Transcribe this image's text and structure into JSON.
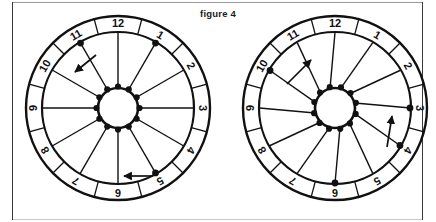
{
  "figure": {
    "title": "figure 4",
    "background_color": "#ffffff",
    "ink_color": "#111111",
    "frame_color": "#3a3a3a"
  },
  "chart_data": {
    "type": "diagram",
    "title": "figure 4",
    "subtitle": "",
    "xlabel": "",
    "ylabel": "",
    "panels": [
      {
        "id": "left",
        "name": "wheel-left",
        "ring_labels": [
          "12",
          "1",
          "2",
          "3",
          "4",
          "5",
          "6",
          "7",
          "8",
          "9",
          "10",
          "11"
        ],
        "segment_count": 12,
        "spoke_count": 12,
        "hub_dot_count": 12,
        "rim_dot_positions": [
          "11",
          "1",
          "5"
        ],
        "hub_offset_degrees": 0,
        "arrows": [
          {
            "name": "arrow-upper-left",
            "direction": "counterclockwise",
            "glyph": "arrow-left-down",
            "near_label": "10"
          },
          {
            "name": "arrow-lower",
            "direction": "counterclockwise",
            "glyph": "arrow-left",
            "near_label": "6"
          }
        ]
      },
      {
        "id": "right",
        "name": "wheel-right",
        "ring_labels": [
          "12",
          "1",
          "2",
          "3",
          "4",
          "5",
          "6",
          "7",
          "8",
          "9",
          "10",
          "11"
        ],
        "segment_count": 12,
        "spoke_count": 12,
        "hub_dot_count": 12,
        "rim_dot_positions": [
          "10",
          "3",
          "4",
          "6"
        ],
        "hub_offset_degrees": -14,
        "arrows": [
          {
            "name": "arrow-upper-left",
            "direction": "clockwise",
            "glyph": "arrow-up-right",
            "near_label": "11"
          },
          {
            "name": "arrow-right",
            "direction": "clockwise",
            "glyph": "arrow-up",
            "near_label": "3"
          }
        ]
      }
    ]
  }
}
